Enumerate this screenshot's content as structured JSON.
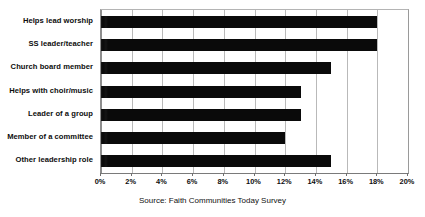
{
  "chart_data": {
    "type": "bar",
    "orientation": "horizontal",
    "title": "",
    "subtitle": "",
    "xlabel": "",
    "ylabel": "",
    "categories": [
      "Helps lead worship",
      "SS leader/teacher",
      "Church board member",
      "Helps with choir/music",
      "Leader of a group",
      "Member of a committee",
      "Other leadership role"
    ],
    "values": [
      18,
      18,
      15,
      13,
      13,
      12,
      15
    ],
    "value_unit": "%",
    "xlim": [
      0,
      20
    ],
    "xticks": [
      0,
      2,
      4,
      6,
      8,
      10,
      12,
      14,
      16,
      18,
      20
    ],
    "xtick_labels": [
      "0%",
      "2%",
      "4%",
      "6%",
      "8%",
      "10%",
      "12%",
      "14%",
      "16%",
      "18%",
      "20%"
    ],
    "grid": true,
    "grid_axis": "x",
    "legend": false,
    "legend_position": "none",
    "series": [
      {
        "name": "Percent of respondents",
        "values": [
          18,
          18,
          15,
          13,
          13,
          12,
          15
        ],
        "color": "#0a0a0a"
      }
    ],
    "annotations": []
  },
  "caption": {
    "source_text": "Source: Faith Communities Today Survey"
  },
  "colors": {
    "bar": "#0a0a0a",
    "gridline": "#b9b9b9",
    "axis": "#8e8e8e",
    "text": "#0d0d0d",
    "background": "#ffffff"
  }
}
